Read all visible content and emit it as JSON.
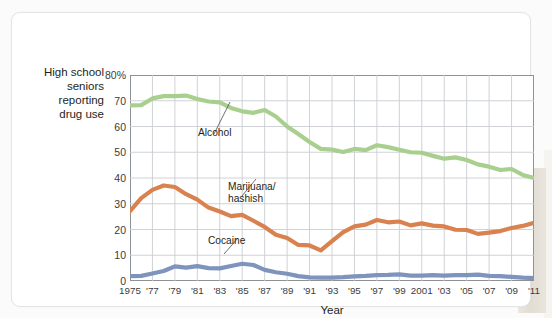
{
  "chart_data": {
    "type": "line",
    "title": "",
    "xlabel": "Year",
    "ylabel": "High school seniors reporting drug use",
    "ylim": [
      0,
      80
    ],
    "xlim": [
      1975,
      2011
    ],
    "grid": true,
    "legend_position": "inline-annotations",
    "y_ticks": [
      "0",
      "10",
      "20",
      "30",
      "40",
      "50",
      "60",
      "70",
      "80%"
    ],
    "y_tick_values": [
      0,
      10,
      20,
      30,
      40,
      50,
      60,
      70,
      80
    ],
    "x_ticks": [
      "1975",
      "'77",
      "'79",
      "'81",
      "'83",
      "'85",
      "'87",
      "'89",
      "'91",
      "'93",
      "'95",
      "'97",
      "'99",
      "2001",
      "'03",
      "'05",
      "'07",
      "'09",
      "'11"
    ],
    "x_tick_values": [
      1975,
      1977,
      1979,
      1981,
      1983,
      1985,
      1987,
      1989,
      1991,
      1993,
      1995,
      1997,
      1999,
      2001,
      2003,
      2005,
      2007,
      2009,
      2011
    ],
    "x": [
      1975,
      1976,
      1977,
      1978,
      1979,
      1980,
      1981,
      1982,
      1983,
      1984,
      1985,
      1986,
      1987,
      1988,
      1989,
      1990,
      1991,
      1992,
      1993,
      1994,
      1995,
      1996,
      1997,
      1998,
      1999,
      2000,
      2001,
      2002,
      2003,
      2004,
      2005,
      2006,
      2007,
      2008,
      2009,
      2010,
      2011
    ],
    "series": [
      {
        "name": "Alcohol",
        "color": "#a9cf8f",
        "values": [
          68.2,
          68.3,
          70.9,
          71.8,
          71.8,
          72.0,
          70.7,
          69.7,
          69.4,
          67.2,
          65.9,
          65.3,
          66.4,
          63.9,
          60.0,
          57.1,
          54.0,
          51.3,
          51.0,
          50.1,
          51.3,
          50.8,
          52.7,
          52.0,
          51.0,
          50.0,
          49.8,
          48.6,
          47.5,
          48.0,
          47.0,
          45.3,
          44.4,
          43.1,
          43.5,
          41.2,
          40.0
        ]
      },
      {
        "name": "Marijuana/hashish",
        "color": "#d9824f",
        "values": [
          27.1,
          32.2,
          35.4,
          37.1,
          36.5,
          33.7,
          31.6,
          28.5,
          27.0,
          25.2,
          25.7,
          23.4,
          21.0,
          18.0,
          16.7,
          14.0,
          13.8,
          11.9,
          15.5,
          19.0,
          21.2,
          21.9,
          23.7,
          22.8,
          23.1,
          21.6,
          22.4,
          21.5,
          21.2,
          19.9,
          19.8,
          18.3,
          18.8,
          19.4,
          20.6,
          21.4,
          22.6
        ]
      },
      {
        "name": "Cocaine",
        "color": "#7e94bd",
        "values": [
          1.9,
          2.0,
          2.9,
          3.9,
          5.7,
          5.2,
          5.8,
          5.0,
          4.9,
          5.8,
          6.7,
          6.2,
          4.3,
          3.4,
          2.8,
          1.9,
          1.4,
          1.3,
          1.3,
          1.5,
          1.8,
          2.0,
          2.3,
          2.4,
          2.6,
          2.1,
          2.1,
          2.3,
          2.1,
          2.3,
          2.3,
          2.5,
          2.0,
          1.9,
          1.6,
          1.3,
          1.1
        ]
      }
    ],
    "annotations": [
      {
        "name": "Alcohol",
        "label": "Alcohol"
      },
      {
        "name": "Marijuana/hashish",
        "label_line1": "Marijuana/",
        "label_line2": "hashish"
      },
      {
        "name": "Cocaine",
        "label": "Cocaine"
      }
    ]
  },
  "axis": {
    "y_title_line1": "High school",
    "y_title_line2": "seniors",
    "y_title_line3": "reporting",
    "y_title_line4": "drug use",
    "x_title": "Year"
  },
  "annotations": {
    "alcohol": "Alcohol",
    "marijuana_l1": "Marijuana/",
    "marijuana_l2": "hashish",
    "cocaine": "Cocaine"
  },
  "colors": {
    "alcohol": "#a9cf8f",
    "marijuana": "#d9824f",
    "cocaine": "#7e94bd",
    "grid": "#c9cdd1",
    "frame": "#8d9296",
    "text": "#231f20",
    "card_border": "#e3e6e6"
  }
}
